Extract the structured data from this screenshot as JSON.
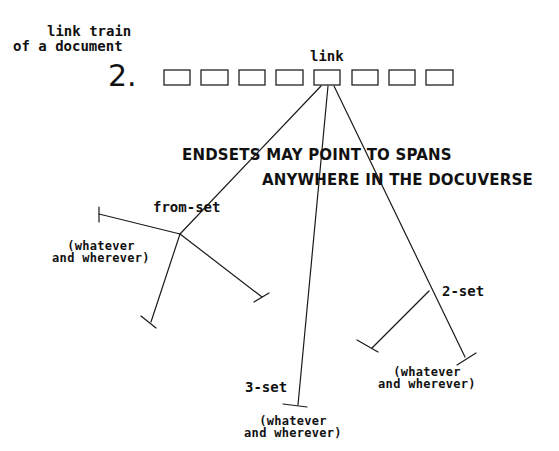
{
  "diagram": {
    "header": {
      "line1": "link train",
      "line2": "of a document"
    },
    "number_label": "2.",
    "link_label": "link",
    "boxes": [
      {
        "x": 164,
        "y": 70,
        "w": 26,
        "h": 15
      },
      {
        "x": 201,
        "y": 70,
        "w": 27,
        "h": 15
      },
      {
        "x": 239,
        "y": 70,
        "w": 26,
        "h": 15
      },
      {
        "x": 276,
        "y": 70,
        "w": 27,
        "h": 15
      },
      {
        "x": 314,
        "y": 70,
        "w": 26,
        "h": 15
      },
      {
        "x": 352,
        "y": 70,
        "w": 26,
        "h": 15
      },
      {
        "x": 389,
        "y": 70,
        "w": 26,
        "h": 15
      },
      {
        "x": 426,
        "y": 70,
        "w": 27,
        "h": 15
      }
    ],
    "caption": {
      "line1": "ENDSETS MAY POINT TO SPANS",
      "line2": "ANYWHERE IN THE DOCUVERSE"
    },
    "endsets": {
      "from_set": {
        "label": "from-set",
        "note_line1": "(whatever",
        "note_line2": "and wherever)"
      },
      "three_set": {
        "label": "3-set",
        "note_line1": "(whatever",
        "note_line2": "and wherever)"
      },
      "two_set": {
        "label": "2-set",
        "note_line1": "(whatever",
        "note_line2": "and wherever)"
      }
    },
    "line_color": "#1a1a1a"
  }
}
